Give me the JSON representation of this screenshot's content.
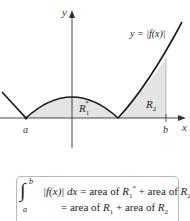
{
  "figure": {
    "curve_label": "y = |f(x)|",
    "y_axis_label": "y",
    "x_axis_label": "x",
    "point_a": "a",
    "point_b": "b",
    "region1_label": "R",
    "region1_sub": "1",
    "region1_sup": "*",
    "region2_label": "R",
    "region2_sub": "2",
    "colors": {
      "curve": "#1a1a1a",
      "shade": "#e4e4e4",
      "axis": "#333333"
    }
  },
  "formula": {
    "integral_symbol": "∫",
    "lower_limit": "a",
    "upper_limit": "b",
    "integrand": "|f(x)| dx",
    "line1_rhs_prefix": "= area of ",
    "line1_r1": "R",
    "line1_r1_sub": "1",
    "line1_r1_sup": "*",
    "line1_mid": " + area of ",
    "line1_r2": "R",
    "line1_r2_sub": "2",
    "line2_prefix": "= area of ",
    "line2_r1": "R",
    "line2_r1_sub": "1",
    "line2_mid": " + area of ",
    "line2_r2": "R",
    "line2_r2_sub": "2"
  }
}
